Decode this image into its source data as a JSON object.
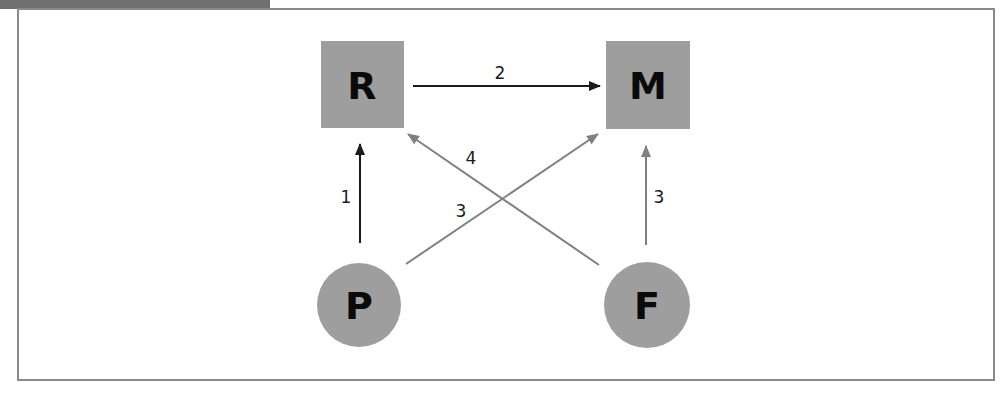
{
  "colors": {
    "node_fill": "#9e9e9e",
    "arrow_dark": "#1a1a1a",
    "arrow_gray": "#808080",
    "frame_border": "#8a8a8a",
    "header_tab": "#6f6f6f"
  },
  "nodes": [
    {
      "id": "R",
      "label": "R",
      "shape": "square"
    },
    {
      "id": "M",
      "label": "M",
      "shape": "square"
    },
    {
      "id": "P",
      "label": "P",
      "shape": "circle"
    },
    {
      "id": "F",
      "label": "F",
      "shape": "circle"
    }
  ],
  "edges": [
    {
      "from": "P",
      "to": "R",
      "label": "1",
      "color": "dark"
    },
    {
      "from": "R",
      "to": "M",
      "label": "2",
      "color": "dark"
    },
    {
      "from": "P",
      "to": "M",
      "label": "3",
      "color": "gray"
    },
    {
      "from": "F",
      "to": "R",
      "label": "4",
      "color": "gray"
    },
    {
      "from": "F",
      "to": "M",
      "label": "3",
      "color": "gray"
    }
  ]
}
